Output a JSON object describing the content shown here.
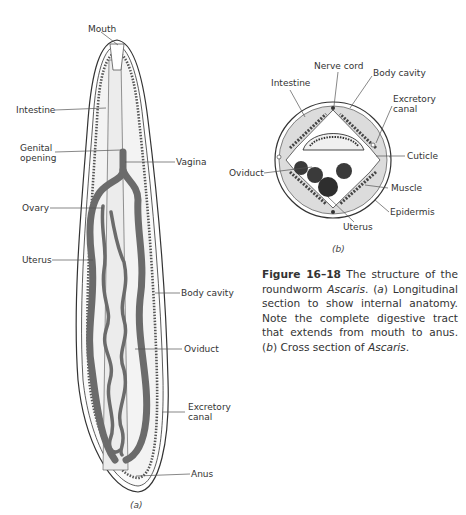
{
  "figure": {
    "number": "Figure 16–18",
    "caption_parts": {
      "p1": " The structure of the roundworm ",
      "i1": "Ascaris",
      "p2": ". (",
      "i2": "a",
      "p3": ") Longitudinal section to show internal anatomy. Note the complete digestive tract that extends from mouth to anus. (",
      "i3": "b",
      "p4": ") Cross section of ",
      "i4": "Ascaris",
      "p5": "."
    }
  },
  "panel_a": {
    "sublabel": "(a)",
    "labels": {
      "mouth": "Mouth",
      "intestine": "Intestine",
      "genital1": "Genital",
      "genital2": "opening",
      "vagina": "Vagina",
      "ovary": "Ovary",
      "uterus": "Uterus",
      "body_cavity": "Body cavity",
      "oviduct": "Oviduct",
      "excretory1": "Excretory",
      "excretory2": "canal",
      "anus": "Anus"
    }
  },
  "panel_b": {
    "sublabel": "(b)",
    "labels": {
      "nerve_cord": "Nerve cord",
      "intestine": "Intestine",
      "body_cavity": "Body cavity",
      "excretory1": "Excretory",
      "excretory2": "canal",
      "cuticle": "Cuticle",
      "oviduct": "Oviduct",
      "muscle": "Muscle",
      "epidermis": "Epidermis",
      "uterus": "Uterus"
    }
  },
  "colors": {
    "organ": "#6b6b6b",
    "outline": "#333333",
    "cavity": "#f2f2f2",
    "ring": "#dcdcdc"
  }
}
